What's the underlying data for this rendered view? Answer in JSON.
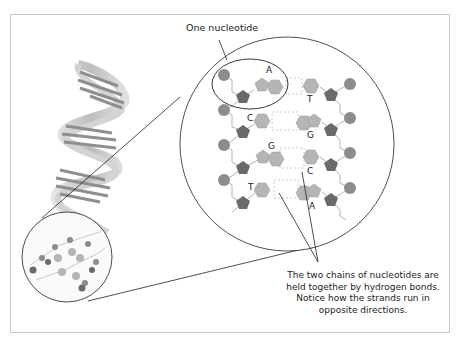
{
  "diagram": {
    "title_label": "One nucleotide",
    "caption_lines": [
      "The two chains of nucleotides are",
      "held together by hydrogen bonds.",
      "Notice how the strands run in",
      "opposite directions."
    ],
    "left_strand_bases": [
      "A",
      "C",
      "G",
      "T"
    ],
    "right_strand_bases": [
      "T",
      "G",
      "C",
      "A"
    ],
    "parts": [
      "phosphate",
      "sugar",
      "base"
    ],
    "colors": {
      "phosphate": "#8c8c8c",
      "sugar": "#6a6a6a",
      "base": "#b5b5b5",
      "hydrogen_bond": "#c4c4c4",
      "outline": "#333333",
      "frame": "#c8c8c8"
    }
  }
}
